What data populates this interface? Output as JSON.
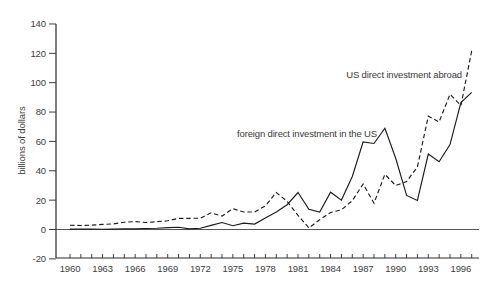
{
  "colors": {
    "background": "#ffffff",
    "axis": "#2a2a2a",
    "line": "#1c1c1c",
    "text": "#3d3d3d"
  },
  "chart_data": {
    "type": "line",
    "title": "",
    "xlabel": "",
    "ylabel": "billions of dollars",
    "ylim": [
      -20,
      140
    ],
    "grid": false,
    "legend_position": "inline-annotations",
    "x": [
      1960,
      1961,
      1962,
      1963,
      1964,
      1965,
      1966,
      1967,
      1968,
      1969,
      1970,
      1971,
      1972,
      1973,
      1974,
      1975,
      1976,
      1977,
      1978,
      1979,
      1980,
      1981,
      1982,
      1983,
      1984,
      1985,
      1986,
      1987,
      1988,
      1989,
      1990,
      1991,
      1992,
      1993,
      1994,
      1995,
      1996,
      1997
    ],
    "series": [
      {
        "name": "US direct investment abroad",
        "style": "dashed",
        "values": [
          2.9,
          2.7,
          2.9,
          3.5,
          3.8,
          5.0,
          5.4,
          4.8,
          5.3,
          5.9,
          7.6,
          7.6,
          7.7,
          11.4,
          9.1,
          14.2,
          11.9,
          11.9,
          16.1,
          25.2,
          19.2,
          9.6,
          1.1,
          6.7,
          11.6,
          13.4,
          19.6,
          31.0,
          17.9,
          37.6,
          30.0,
          32.7,
          42.6,
          77.2,
          73.3,
          92.1,
          84.4,
          121.8
        ]
      },
      {
        "name": "foreign direct investment in the US",
        "style": "solid",
        "values": [
          0.3,
          0.3,
          0.3,
          0.2,
          0.3,
          0.4,
          0.4,
          0.7,
          0.8,
          1.3,
          1.5,
          0.4,
          0.9,
          2.8,
          4.8,
          2.6,
          4.3,
          3.7,
          7.9,
          11.9,
          16.9,
          25.2,
          13.8,
          11.9,
          25.4,
          20.0,
          36.1,
          59.6,
          58.6,
          69.0,
          48.5,
          23.2,
          19.8,
          51.4,
          46.1,
          57.8,
          86.5,
          93.4
        ]
      }
    ],
    "y_ticks": [
      -20,
      0,
      20,
      40,
      60,
      80,
      100,
      120,
      140
    ],
    "x_tick_label_years": [
      1960,
      1963,
      1966,
      1969,
      1972,
      1975,
      1978,
      1981,
      1984,
      1987,
      1990,
      1993,
      1996
    ],
    "zero_line": true,
    "annotations": [
      {
        "text": "US direct investment abroad",
        "series": "US direct investment abroad"
      },
      {
        "text": "foreign direct investment in the US",
        "series": "foreign direct investment in the US"
      }
    ]
  }
}
